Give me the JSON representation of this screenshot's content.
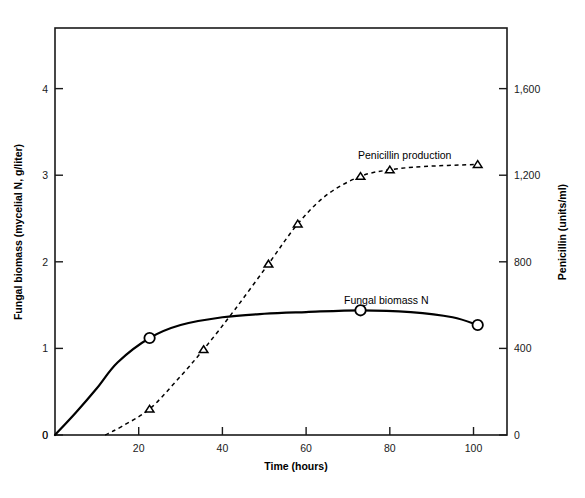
{
  "chart_data": {
    "type": "line",
    "title": "",
    "xlabel": "Time (hours)",
    "xlim": [
      0,
      108
    ],
    "xticks": [
      0,
      20,
      40,
      60,
      80,
      100
    ],
    "xticklabels": [
      "0",
      "20",
      "40",
      "60",
      "80",
      "100"
    ],
    "grid": false,
    "legend_position": "inline-annotations",
    "axes": [
      {
        "id": "left",
        "ylabel": "Fungal biomass (mycelial N, g/liter)",
        "ylim": [
          0,
          4.7
        ],
        "yticks": [
          0,
          1,
          2,
          3,
          4
        ],
        "yticklabels": [
          "0",
          "1",
          "2",
          "3",
          "4"
        ]
      },
      {
        "id": "right",
        "ylabel": "Penicillin (units/ml)",
        "ylim": [
          0,
          1880
        ],
        "yticks": [
          0,
          400,
          800,
          1200,
          1600
        ],
        "yticklabels": [
          "0",
          "400",
          "800",
          "1,200",
          "1,600"
        ]
      }
    ],
    "series": [
      {
        "name": "Fungal biomass N",
        "axis": "left",
        "linestyle": "solid",
        "marker": "circle",
        "annotation": "Fungal biomass N",
        "x": [
          0,
          5,
          10,
          15,
          22.6,
          30,
          40,
          50,
          60,
          73,
          85,
          95,
          101
        ],
        "y": [
          0,
          0.26,
          0.54,
          0.84,
          1.12,
          1.27,
          1.36,
          1.4,
          1.42,
          1.44,
          1.42,
          1.36,
          1.27
        ],
        "marker_points": [
          {
            "x": 22.6,
            "y": 1.12
          },
          {
            "x": 73,
            "y": 1.44
          },
          {
            "x": 101,
            "y": 1.27
          }
        ]
      },
      {
        "name": "Penicillin production",
        "axis": "right",
        "linestyle": "dashed",
        "marker": "triangle",
        "annotation": "Penicillin production",
        "x": [
          12,
          16,
          22.6,
          29,
          35.5,
          43,
          51,
          58,
          65,
          73,
          80,
          88,
          101
        ],
        "y": [
          0,
          40,
          120,
          250,
          395,
          580,
          790,
          975,
          1110,
          1195,
          1225,
          1240,
          1250
        ],
        "marker_points": [
          {
            "x": 22.6,
            "y": 120
          },
          {
            "x": 35.5,
            "y": 395
          },
          {
            "x": 51,
            "y": 790
          },
          {
            "x": 58,
            "y": 975
          },
          {
            "x": 73,
            "y": 1195
          },
          {
            "x": 80,
            "y": 1225
          },
          {
            "x": 101,
            "y": 1250
          }
        ]
      }
    ]
  },
  "colors": {
    "axis": "#1a1a1a",
    "curve": "#000000",
    "background": "#ffffff",
    "marker_fill": "#ffffff"
  }
}
